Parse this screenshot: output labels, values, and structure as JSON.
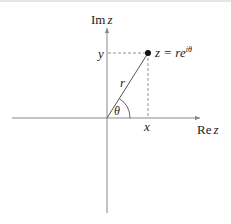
{
  "diagram": {
    "axes": {
      "imaginary_label_prefix": "Im",
      "imaginary_label_var": "z",
      "real_label_prefix": "Re",
      "real_label_var": "z"
    },
    "point": {
      "label_lhs": "z = re",
      "label_exponent": "iθ"
    },
    "labels": {
      "x": "x",
      "y": "y",
      "r": "r",
      "theta": "θ"
    },
    "colors": {
      "axis": "#888888",
      "line": "#555555",
      "dashed": "#777777",
      "point": "#111111",
      "text": "#222222"
    }
  }
}
